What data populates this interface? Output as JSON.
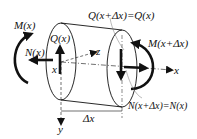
{
  "diagram": {
    "labels": {
      "moment_left": "M(x)",
      "normal_left": "N(x)",
      "shear_left": "Q(x)",
      "shear_right": "Q(x+Δx)=Q(x)",
      "moment_right": "M(x+Δx)",
      "normal_right": "N(x+Δx)=N(x)",
      "axis_x_origin": "x",
      "axis_x": "x",
      "axis_y": "y",
      "axis_z": "z",
      "length": "Δx"
    },
    "colors": {
      "stroke": "#111111",
      "background": "#ffffff",
      "leader": "#777777"
    }
  }
}
